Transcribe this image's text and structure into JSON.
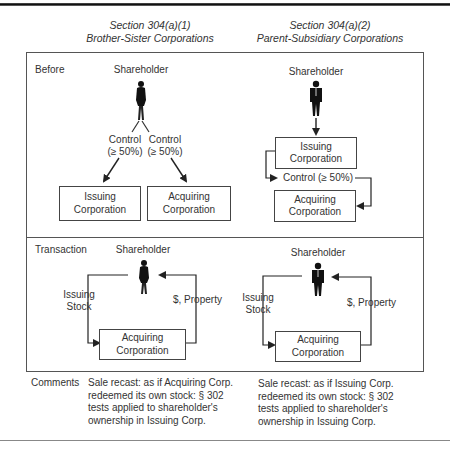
{
  "columns": [
    {
      "section": "Section 304(a)(1)",
      "subtitle": "Brother-Sister Corporations"
    },
    {
      "section": "Section 304(a)(2)",
      "subtitle": "Parent-Subsidiary Corporations"
    }
  ],
  "rows": {
    "before": {
      "label": "Before",
      "left": {
        "actor": "Shareholder",
        "actor_icon": "woman-figure-icon",
        "control_left": [
          "Control",
          "(≥ 50%)"
        ],
        "control_right": [
          "Control",
          "(≥ 50%)"
        ],
        "box_issuing": [
          "Issuing",
          "Corporation"
        ],
        "box_acquiring": [
          "Acquiring",
          "Corporation"
        ]
      },
      "right": {
        "actor": "Shareholder",
        "actor_icon": "man-figure-icon",
        "box_issuing": [
          "Issuing",
          "Corporation"
        ],
        "control": "Control (≥ 50%)",
        "box_acquiring": [
          "Acquiring",
          "Corporation"
        ]
      }
    },
    "transaction": {
      "label": "Transaction",
      "left": {
        "actor": "Shareholder",
        "actor_icon": "woman-figure-icon",
        "flow_out": [
          "Issuing",
          "Stock"
        ],
        "flow_in": "$, Property",
        "box_acquiring": [
          "Acquiring",
          "Corporation"
        ]
      },
      "right": {
        "actor": "Shareholder",
        "actor_icon": "man-figure-icon",
        "flow_out": [
          "Issuing",
          "Stock"
        ],
        "flow_in": "$, Property",
        "box_acquiring": [
          "Acquiring",
          "Corporation"
        ]
      }
    },
    "comments": {
      "label": "Comments",
      "left": [
        "Sale recast: as if Acquiring Corp.",
        "redeemed its own stock: § 302",
        "tests applied to shareholder's",
        "ownership in Issuing Corp."
      ],
      "right": [
        "Sale recast: as if Issuing Corp.",
        "redeemed its own stock: § 302",
        "tests applied to shareholder's",
        "ownership in Issuing Corp."
      ]
    }
  },
  "colors": {
    "line": "#333333",
    "frame": "#555555",
    "text": "#333333"
  }
}
